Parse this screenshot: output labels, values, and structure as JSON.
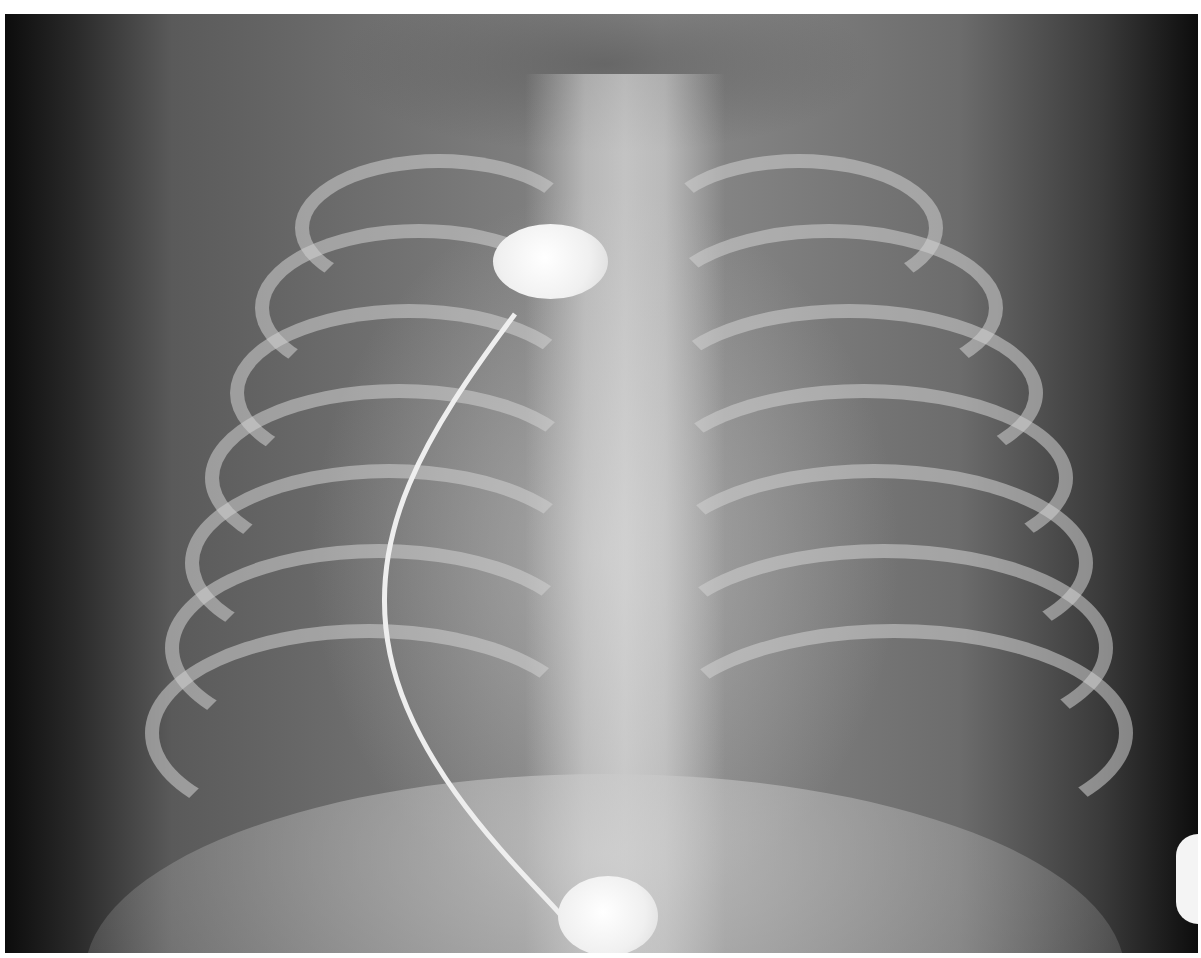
{
  "image": {
    "type": "radiograph",
    "view": "frontal chest X-ray",
    "subject": "infant chest",
    "features": [
      "rib cage",
      "spine",
      "ECG electrode (upper chest)",
      "ECG electrode (lower abdomen)",
      "electrode lead wire",
      "partial electrode at right edge"
    ]
  },
  "colors": {
    "background": "#ffffff",
    "film_dark": "#0c0c0c",
    "film_mid": "#7a7a7a",
    "electrode": "#f4f4f4"
  }
}
